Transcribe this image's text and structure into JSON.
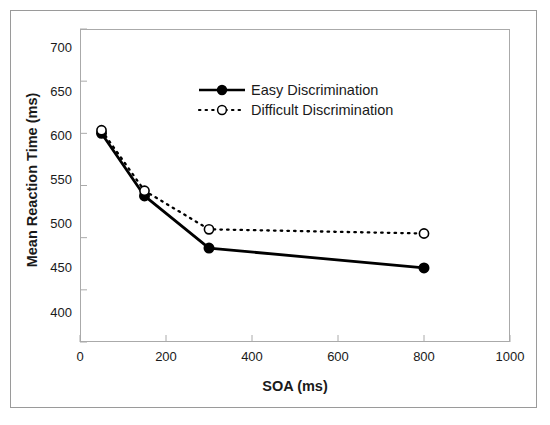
{
  "chart_data": {
    "type": "line",
    "title": "",
    "xlabel": "SOA (ms)",
    "ylabel": "Mean Reaction Time (ms)",
    "xlim": [
      0,
      1000
    ],
    "ylim": [
      400,
      700
    ],
    "xticks": [
      0,
      200,
      400,
      600,
      800,
      1000
    ],
    "yticks": [
      400,
      450,
      500,
      550,
      600,
      650,
      700
    ],
    "xtick_labels": [
      "0",
      "200",
      "400",
      "600",
      "800",
      "1000"
    ],
    "ytick_labels": [
      "400",
      "450",
      "500",
      "550",
      "600",
      "650",
      "700"
    ],
    "grid": false,
    "legend_position": "upper-center-inside",
    "x": [
      50,
      150,
      300,
      800
    ],
    "series": [
      {
        "name": "Easy Discrimination",
        "values": [
          600,
          540,
          490,
          471
        ],
        "line_style": "solid",
        "marker": "filled-circle",
        "color": "#000000"
      },
      {
        "name": "Difficult Discrimination",
        "values": [
          603,
          545,
          508,
          504
        ],
        "line_style": "dotted",
        "marker": "open-circle",
        "color": "#000000"
      }
    ]
  },
  "figure": {
    "axis_color": "#aaaaaa",
    "border_color": "#9a9a9a",
    "data_color": "#000000",
    "background": "#ffffff"
  }
}
